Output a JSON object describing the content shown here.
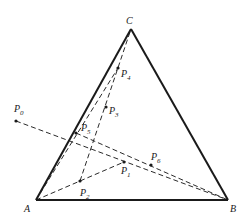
{
  "figure": {
    "vertices": [
      {
        "id": "A",
        "label": "A"
      },
      {
        "id": "B",
        "label": "B"
      },
      {
        "id": "C",
        "label": "C"
      }
    ],
    "points": [
      {
        "id": "P0",
        "base": "P",
        "sub": "0"
      },
      {
        "id": "P1",
        "base": "P",
        "sub": "1"
      },
      {
        "id": "P2",
        "base": "P",
        "sub": "2"
      },
      {
        "id": "P3",
        "base": "P",
        "sub": "3"
      },
      {
        "id": "P4",
        "base": "P",
        "sub": "4"
      },
      {
        "id": "P5",
        "base": "P",
        "sub": "5"
      },
      {
        "id": "P6",
        "base": "P",
        "sub": "6"
      }
    ],
    "solid_edges": [
      [
        "A",
        "B"
      ],
      [
        "B",
        "C"
      ],
      [
        "C",
        "A"
      ]
    ],
    "dashed_edges": [
      [
        "P0",
        "B"
      ],
      [
        "A",
        "P1"
      ],
      [
        "P2",
        "C"
      ],
      [
        "A",
        "P4"
      ],
      [
        "P5",
        "B"
      ]
    ],
    "colors": {
      "ink": "#1a1a1a",
      "background": "#ffffff"
    }
  }
}
